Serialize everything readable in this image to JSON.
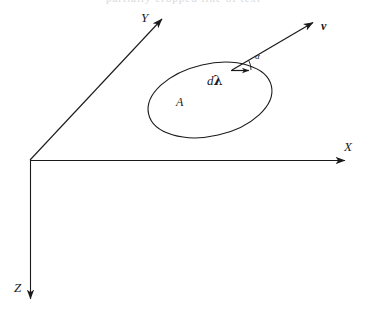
{
  "figure": {
    "domain": "diagram",
    "kind": "3d-coordinate-axes-with-planar-loop",
    "background_color": "#ffffff",
    "stroke_color": "#1a1a1a",
    "width": 367,
    "height": 316,
    "top_cut_text": "partially cropped line of text"
  },
  "axes": {
    "origin": {
      "x": 30,
      "y": 160
    },
    "x_axis": {
      "label": "X",
      "label_pos": {
        "x": 344,
        "y": 140
      },
      "from": {
        "x": 30,
        "y": 160
      },
      "to": {
        "x": 352,
        "y": 160
      }
    },
    "y_axis": {
      "label": "Y",
      "label_pos": {
        "x": 141,
        "y": 11
      },
      "from": {
        "x": 30,
        "y": 160
      },
      "to": {
        "x": 168,
        "y": 13
      }
    },
    "z_axis": {
      "label": "Z",
      "label_pos": {
        "x": 14,
        "y": 281
      },
      "from": {
        "x": 30,
        "y": 160
      },
      "to": {
        "x": 30,
        "y": 306
      }
    }
  },
  "loop": {
    "label": "A",
    "label_pos": {
      "x": 176,
      "y": 96
    },
    "center": {
      "x": 210,
      "y": 100
    },
    "radius_x": 63,
    "radius_y": 36,
    "rotation_deg": -13
  },
  "vectors": {
    "velocity": {
      "label": "v",
      "label_pos": {
        "x": 321,
        "y": 20
      },
      "from": {
        "x": 232,
        "y": 70
      },
      "to": {
        "x": 319,
        "y": 19
      },
      "bold": true
    },
    "line_element": {
      "label_d": "d",
      "label_lambda": "λ",
      "label_pos": {
        "x": 207,
        "y": 74
      },
      "from": {
        "x": 232,
        "y": 70
      },
      "to": {
        "x": 254,
        "y": 70
      }
    }
  },
  "angle": {
    "label": "α",
    "label_pos": {
      "x": 255,
      "y": 56
    },
    "vertex": {
      "x": 232,
      "y": 70
    },
    "arc_radius": 18,
    "from_deg": 0,
    "to_deg": -30
  }
}
